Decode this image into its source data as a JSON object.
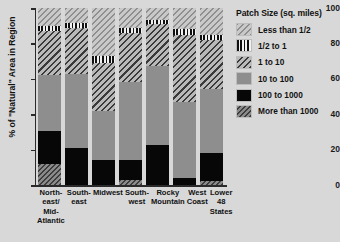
{
  "chart_data": {
    "type": "bar",
    "subtype": "stacked-bar-100pct",
    "title": "",
    "xlabel": "",
    "ylabel": "% of \"Natural\" Area in Region",
    "ylim": [
      0,
      100
    ],
    "yticks": [
      0,
      20,
      40,
      60,
      80,
      100
    ],
    "grid": false,
    "legend_position": "right",
    "legend_title": "Patch Size (sq. miles)",
    "categories": [
      "North-\neast/\nMid-\nAtlantic",
      "South-\neast",
      "Midwest",
      "South-\nwest",
      "Rocky\nMountain",
      "West\nCoast",
      "Lower\n48 States"
    ],
    "category_lines": [
      [
        "North-",
        "east/",
        "Mid-",
        "Atlantic"
      ],
      [
        "South-",
        "east"
      ],
      [
        "Midwest"
      ],
      [
        "South-",
        "west"
      ],
      [
        "Rocky",
        "Mountain"
      ],
      [
        "West",
        "Coast"
      ],
      [
        "Lower",
        "48 States"
      ]
    ],
    "series": [
      {
        "name": "More than 1000",
        "key": "gt1000",
        "pattern": "diagonal-hatch-dark-gray",
        "color": "#8a8a8a",
        "values": [
          12,
          0,
          0,
          3,
          0,
          0,
          2.5
        ]
      },
      {
        "name": "100 to 1000",
        "key": "s100_1000",
        "pattern": "solid-black",
        "color": "#070707",
        "values": [
          18.5,
          21,
          14,
          11,
          22.5,
          4,
          15.5
        ]
      },
      {
        "name": "10 to 100",
        "key": "s10_100",
        "pattern": "solid-gray",
        "color": "#8e8e8e",
        "values": [
          31.5,
          41.5,
          28,
          44,
          44.5,
          43,
          36
        ]
      },
      {
        "name": "1 to 10",
        "key": "s1_10",
        "pattern": "diagonal-hatch-light-gray",
        "color": "#b9b9b9",
        "values": [
          25,
          26,
          27,
          28,
          24,
          38,
          28
        ]
      },
      {
        "name": "1/2 to 1",
        "key": "half_1",
        "pattern": "vertical-stripes",
        "color": "#f2f2f2",
        "values": [
          3,
          3,
          4,
          3,
          2.5,
          3,
          3
        ]
      },
      {
        "name": "Less than 1/2",
        "key": "lt_half",
        "pattern": "diagonal-hatch-pale",
        "color": "#c9c9c9",
        "values": [
          10,
          8.5,
          27,
          11,
          6.5,
          12,
          15
        ]
      }
    ],
    "legend_entries": [
      {
        "label": "Less than 1/2",
        "key": "lt_half"
      },
      {
        "label": "1/2 to 1",
        "key": "half_1"
      },
      {
        "label": "1 to 10",
        "key": "s1_10"
      },
      {
        "label": "10 to 100",
        "key": "s10_100"
      },
      {
        "label": "100 to 1000",
        "key": "s100_1000"
      },
      {
        "label": "More than 1000",
        "key": "gt1000"
      }
    ]
  },
  "colors": {
    "background": "#d8d8d8",
    "axis": "#2a2a2a",
    "text": "#111111"
  }
}
